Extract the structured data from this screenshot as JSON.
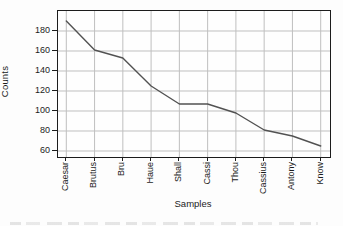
{
  "figure": {
    "title": "",
    "caption_fragment_readable": false
  },
  "chart_data": {
    "type": "line",
    "categories": [
      "Caesar",
      "Brutus",
      "Bru",
      "Haue",
      "Shall",
      "Cassi",
      "Thou",
      "Cassius",
      "Antony",
      "Know"
    ],
    "values": [
      190,
      161,
      153,
      125,
      107,
      107,
      98,
      81,
      75,
      65
    ],
    "title": "",
    "xlabel": "Samples",
    "ylabel": "Counts",
    "yticks": [
      60,
      80,
      100,
      120,
      140,
      160,
      180
    ],
    "ylim": [
      54,
      200
    ],
    "grid": true,
    "legend": false,
    "colors": {
      "line": "#525252",
      "grid": "#bfbfbf",
      "axis": "#1c1c1c",
      "text": "#1c1c1c",
      "background": "#fdfdfd"
    }
  }
}
